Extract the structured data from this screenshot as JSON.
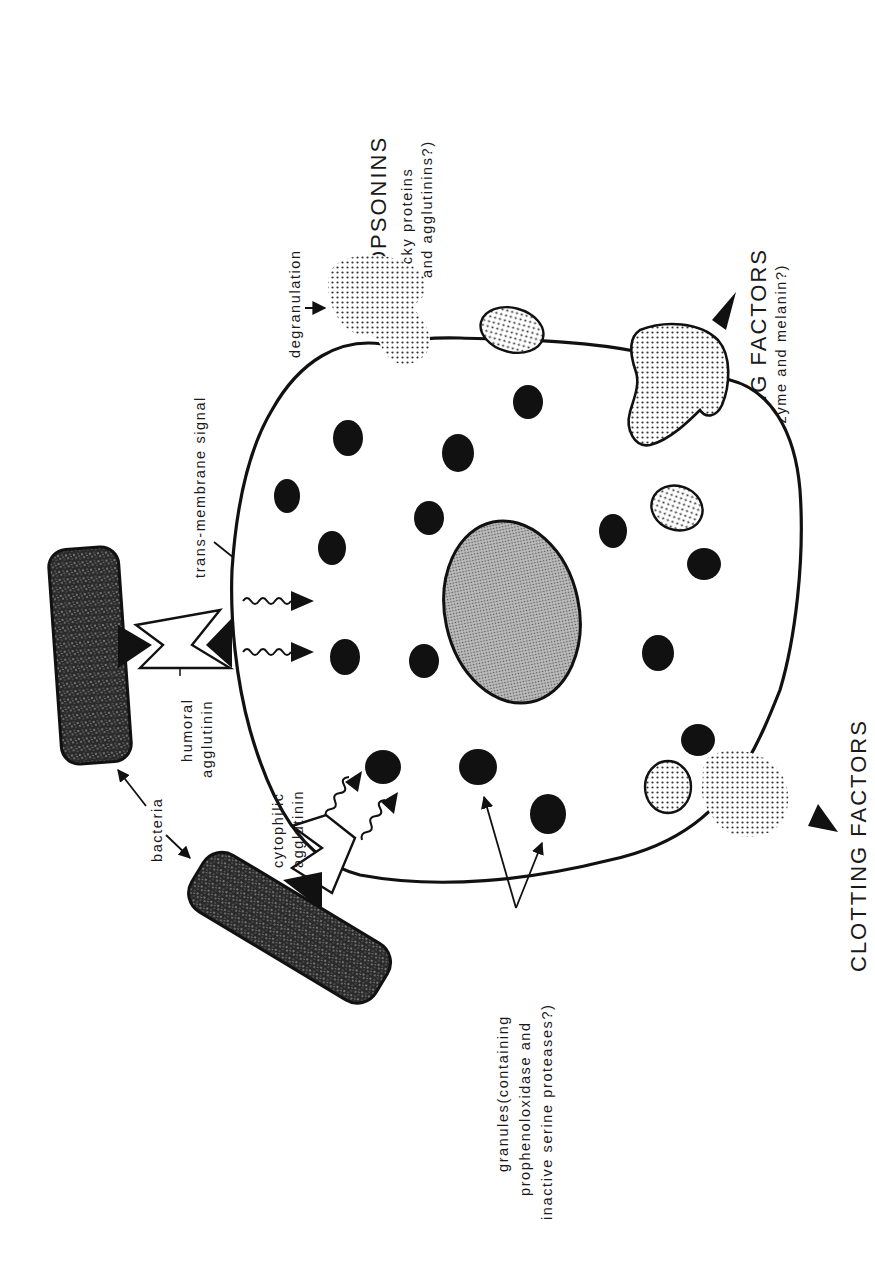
{
  "figure": {
    "orientation": "rotated 90 degrees counter-clockwise"
  },
  "labels": {
    "opsonins_title": "OPSONINS",
    "opsonins_sub1": "(sticky proteins",
    "opsonins_sub2": "and agglutinins?)",
    "degranulation": "degranulation",
    "trans_membrane_signal": "trans-membrane signal",
    "killing_factors_title": "KILLING FACTORS",
    "killing_factors_sub": "(lysozyme and melanin?)",
    "humoral_agglutinin_1": "humoral",
    "humoral_agglutinin_2": "agglutinin",
    "bacteria": "bacteria",
    "cytophilic_agglutinin_1": "cytophilic",
    "cytophilic_agglutinin_2": "agglutinin",
    "granules_1": "granules(containing",
    "granules_2": "prophenoloxidase and",
    "granules_3": "inactive serine proteases?)",
    "clotting_factors_title": "CLOTTING FACTORS"
  },
  "colors": {
    "ink": "#111111",
    "paper": "#ffffff",
    "nucleus_fill": "#9a9a9a",
    "stipple_fill": "#c8c8c8",
    "bacteria_fill": "#3a3a3a"
  }
}
